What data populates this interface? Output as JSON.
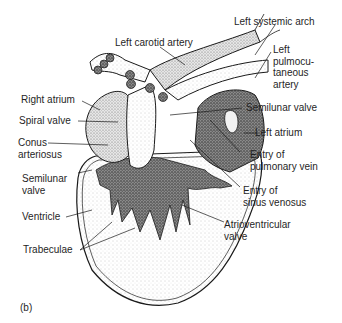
{
  "figure": {
    "panel_label": "(b)",
    "colors": {
      "ink": "#1a1a1a",
      "stipple_dark": "#555555",
      "stipple_light": "#c8c8c8",
      "background": "#ffffff"
    }
  },
  "labels": [
    {
      "id": "left-carotid-artery",
      "text": "Left carotid artery"
    },
    {
      "id": "left-systemic-arch",
      "text": "Left systemic arch"
    },
    {
      "id": "left-pulmocutaneous-artery",
      "text": "Left\npulmocu-\ntaneous\nartery"
    },
    {
      "id": "right-atrium",
      "text": "Right atrium"
    },
    {
      "id": "spiral-valve",
      "text": "Spiral valve"
    },
    {
      "id": "conus-arteriosus",
      "text": "Conus\narteriosus"
    },
    {
      "id": "semilunar-valve-right",
      "text": "Semilunar valve"
    },
    {
      "id": "left-atrium",
      "text": "Left atrium"
    },
    {
      "id": "entry-pulmonary-vein",
      "text": "Entry of\npulmonary vein"
    },
    {
      "id": "semilunar-valve-left",
      "text": "Semilunar\nvalve"
    },
    {
      "id": "entry-sinus-venosus",
      "text": "Entry of\nsinus venosus"
    },
    {
      "id": "ventricle",
      "text": "Ventricle"
    },
    {
      "id": "atrioventricular-valve",
      "text": "Atrioventricular\nvalve"
    },
    {
      "id": "trabeculae",
      "text": "Trabeculae"
    }
  ]
}
